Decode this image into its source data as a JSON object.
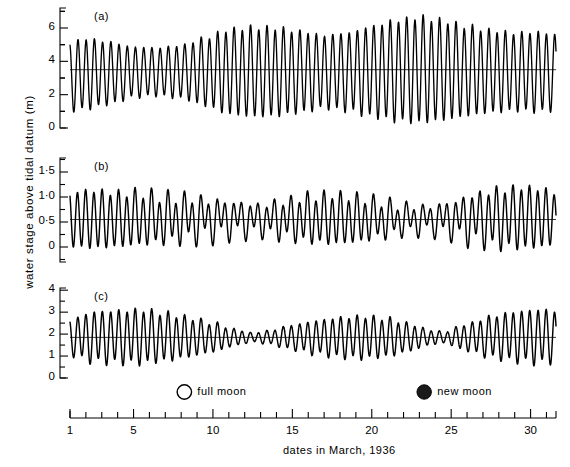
{
  "figure": {
    "ylabel": "water stage above tidal datum (m)",
    "xlabel": "dates in March, 1936"
  },
  "legend": {
    "full_moon_label": "full moon",
    "new_moon_label": "new moon",
    "full_moon_symbol": "open-circle",
    "new_moon_symbol": "filled-circle",
    "full_moon_day": 8.2,
    "new_moon_day": 23.3
  },
  "axis": {
    "x_tick_labels": [
      "1",
      "5",
      "10",
      "15",
      "20",
      "25",
      "30"
    ],
    "x_tick_values": [
      1,
      5,
      10,
      15,
      20,
      25,
      30
    ],
    "x_minor_step": 1,
    "x_range": [
      1,
      31.6
    ]
  },
  "panels": [
    {
      "id": "a",
      "label": "(a)",
      "y_tick_labels": [
        "0",
        "2",
        "4",
        "6"
      ],
      "y_tick_values": [
        0,
        2,
        4,
        6
      ],
      "y_minor_values": [
        1,
        3,
        5,
        7
      ],
      "ylim": [
        0,
        7.2
      ],
      "mean_level": 3.5
    },
    {
      "id": "b",
      "label": "(b)",
      "y_tick_labels": [
        "0",
        "0·5",
        "1·0",
        "1·5"
      ],
      "y_tick_values": [
        0,
        0.5,
        1.0,
        1.5
      ],
      "y_minor_values": [
        -0.25,
        1.75
      ],
      "ylim": [
        -0.3,
        1.78
      ],
      "mean_level": 0.55
    },
    {
      "id": "c",
      "label": "(c)",
      "y_tick_labels": [
        "0",
        "1",
        "2",
        "3",
        "4"
      ],
      "y_tick_values": [
        0,
        1,
        2,
        3,
        4
      ],
      "y_minor_values": [],
      "ylim": [
        0,
        4.1
      ],
      "mean_level": 1.85
    }
  ],
  "chart_data": {
    "type": "line",
    "title": "",
    "xlabel": "dates in March, 1936",
    "ylabel": "water stage above tidal datum (m)",
    "x_unit": "days of March 1936",
    "grid": false,
    "legend_position": "below-plots",
    "series": [
      {
        "name": "(a) semidiurnal tide with strong spring-neap modulation",
        "panel": "a",
        "ylim": [
          0,
          7.2
        ],
        "mean_level": 3.5,
        "tide_type": "semidiurnal",
        "period_hours": 12.42,
        "description": "Two nearly equal highs and lows each day; range grows from about 4 m at neaps to about 5.5 m at springs.",
        "envelope_days": [
          1,
          2,
          3.5,
          5,
          6.5,
          8,
          9.5,
          11,
          12.5,
          14,
          15.5,
          17,
          18.5,
          20,
          21.5,
          23,
          24.5,
          26,
          27.5,
          29,
          30.5,
          31.6
        ],
        "envelope_high": [
          5.1,
          5.35,
          5.15,
          4.85,
          4.8,
          4.95,
          5.4,
          5.9,
          6.05,
          6.0,
          5.8,
          5.55,
          5.7,
          6.1,
          6.45,
          6.65,
          6.45,
          6.1,
          5.85,
          5.7,
          5.75,
          5.6
        ],
        "envelope_low": [
          1.0,
          1.15,
          1.45,
          1.85,
          1.95,
          1.8,
          1.35,
          0.85,
          0.7,
          0.75,
          0.95,
          1.2,
          1.05,
          0.7,
          0.45,
          0.35,
          0.5,
          0.75,
          0.95,
          1.05,
          1.0,
          1.1
        ]
      },
      {
        "name": "(b) mixed tide with marked diurnal inequality",
        "panel": "b",
        "ylim": [
          -0.3,
          1.78
        ],
        "mean_level": 0.55,
        "tide_type": "mixed, semidiurnal dominant",
        "period_hours": 12.42,
        "description": "Successive highs and lows unequal; inequality largest near days 9-14 and 21-26 where the lower high water nearly vanishes.",
        "envelope_days": [
          1,
          2.5,
          4,
          5.5,
          7,
          8.5,
          10,
          11.5,
          13,
          14.5,
          16,
          17.5,
          19,
          20.5,
          22,
          23.5,
          25,
          26.5,
          28,
          29.5,
          31,
          31.6
        ],
        "envelope_high": [
          1.1,
          1.12,
          1.08,
          1.1,
          1.05,
          1.02,
          0.92,
          0.85,
          0.8,
          0.88,
          1.0,
          1.05,
          1.02,
          0.95,
          0.85,
          0.8,
          0.86,
          1.0,
          1.12,
          1.18,
          1.15,
          1.05
        ],
        "envelope_low": [
          0.02,
          0.0,
          0.02,
          0.05,
          0.08,
          0.12,
          0.2,
          0.28,
          0.3,
          0.24,
          0.14,
          0.08,
          0.1,
          0.18,
          0.26,
          0.3,
          0.25,
          0.14,
          0.04,
          0.0,
          0.02,
          0.1
        ],
        "inequality_strength": [
          0.05,
          0.1,
          0.18,
          0.3,
          0.45,
          0.6,
          0.75,
          0.8,
          0.75,
          0.6,
          0.4,
          0.25,
          0.3,
          0.5,
          0.68,
          0.78,
          0.72,
          0.55,
          0.33,
          0.15,
          0.08,
          0.05
        ]
      },
      {
        "name": "(c) semidiurnal tide with pronounced neap minima",
        "panel": "c",
        "ylim": [
          0,
          4.1
        ],
        "mean_level": 1.85,
        "tide_type": "semidiurnal",
        "period_hours": 12.42,
        "description": "Range collapses to near zero at neaps about days 12 and 24, and reaches about 2.4 m at springs near days 3-5 and 30.",
        "envelope_days": [
          1,
          2.5,
          4,
          5.5,
          7,
          8.5,
          10,
          11.5,
          12.5,
          13.5,
          15,
          16.5,
          18,
          19.5,
          21,
          22.5,
          23.5,
          24.5,
          26,
          27.5,
          29,
          30.5,
          31.6
        ],
        "envelope_high": [
          2.65,
          3.0,
          3.05,
          3.1,
          2.95,
          2.75,
          2.5,
          2.2,
          2.05,
          2.15,
          2.4,
          2.6,
          2.75,
          2.8,
          2.7,
          2.45,
          2.2,
          2.1,
          2.45,
          2.8,
          3.0,
          3.1,
          3.05
        ],
        "envelope_low": [
          1.05,
          0.75,
          0.7,
          0.68,
          0.8,
          0.98,
          1.2,
          1.5,
          1.65,
          1.55,
          1.3,
          1.1,
          0.95,
          0.9,
          1.0,
          1.25,
          1.5,
          1.6,
          1.25,
          0.95,
          0.78,
          0.7,
          0.75
        ]
      }
    ]
  }
}
